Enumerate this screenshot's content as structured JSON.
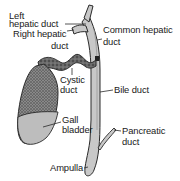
{
  "diagram": {
    "labels": {
      "left_hepatic_duct": [
        "Left",
        "hepatic duct"
      ],
      "right_hepatic_duct": [
        "Right hepatic",
        "duct"
      ],
      "common_hepatic_duct": [
        "Common hepatic",
        "duct"
      ],
      "cystic_duct": [
        "Cystic",
        "duct"
      ],
      "bile_duct": "Bile duct",
      "gall_bladder": [
        "Gall",
        "bladder"
      ],
      "pancreatic_duct": [
        "Pancreatic",
        "duct"
      ],
      "ampulla": "Ampulla"
    },
    "colors": {
      "duct_fill": "#c8c8c8",
      "outline": "#2a2a2a",
      "gallbladder_dark": "#6e6e6e",
      "gallbladder_bile": "#bdbdbd",
      "text": "#1a1a1a"
    }
  }
}
